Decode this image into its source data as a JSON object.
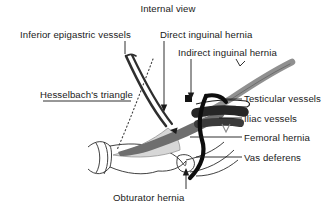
{
  "figure": {
    "title": "Internal view",
    "background_color": "#ffffff",
    "text_color": "#1a1a1a"
  },
  "labels": {
    "internal_view": "Internal view",
    "inferior_epigastric_vessels": "Inferior epigastric vessels",
    "direct_inguinal_hernia": "Direct inguinal hernia",
    "indirect_inguinal_hernia": "Indirect inguinal hernia",
    "hesselbachs_triangle": "Hesselbach's triangle",
    "testicular_vessels": "Testicular vessels",
    "iliac_vessels": "Iliac vessels",
    "femoral_hernia": "Femoral hernia",
    "vas_deferens": "Vas deferens",
    "obturator_hernia": "Obturator hernia"
  },
  "anatomy_colors": {
    "outline": "#2b2b2b",
    "epigastric_vessels": "#3a3a3a",
    "iliac_vessels": "#333333",
    "testicular_cord": "#8c8c8c",
    "femoral_band": "#6e6e6e",
    "hesselbach_fill": "#d6d6d6",
    "vas_deferens": "#111111",
    "dotted_guide": "#4a4a4a"
  }
}
